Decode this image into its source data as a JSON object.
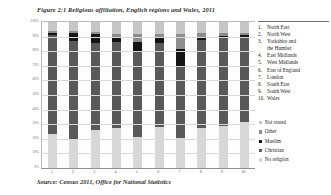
{
  "figure": {
    "title": "Figure 2:1 Religious affiliation, English regions and Wales, 2011",
    "source": "Source: Census 2011, Office for National Statistics"
  },
  "region_list": {
    "items": [
      {
        "num": "1.",
        "name": "North East"
      },
      {
        "num": "2.",
        "name": "North West"
      },
      {
        "num": "3.",
        "name": "Yorkshire and",
        "cont": "the Humber"
      },
      {
        "num": "4.",
        "name": "East Midlands"
      },
      {
        "num": "5.",
        "name": "West Midlands"
      },
      {
        "num": "6.",
        "name": "East of England"
      },
      {
        "num": "7.",
        "name": "London"
      },
      {
        "num": "8.",
        "name": "South East"
      },
      {
        "num": "9.",
        "name": "South West"
      },
      {
        "num": "10.",
        "name": "Wales"
      }
    ]
  },
  "legend": {
    "items": [
      {
        "label": "Not stated",
        "color": "#c6c6c6"
      },
      {
        "label": "Other",
        "color": "#8d8d8d"
      },
      {
        "label": "Muslim",
        "color": "#141414"
      },
      {
        "label": "Christian",
        "color": "#595959"
      },
      {
        "label": "No religion",
        "color": "#d7d7d7"
      }
    ]
  },
  "chart_data": {
    "type": "bar",
    "title": "Figure 2:1 Religious affiliation, English regions and Wales, 2011",
    "subtitle": "",
    "stacked": true,
    "normalized_percent": true,
    "xlabel": "",
    "ylabel": "",
    "ylim": [
      0,
      100
    ],
    "grid": true,
    "legend_position": "right",
    "ytick_labels": [
      "100%",
      "90%",
      "80%",
      "70%",
      "60%",
      "50%",
      "40%",
      "30%",
      "20%",
      "10%",
      "0%"
    ],
    "ytick_values": [
      100,
      90,
      80,
      70,
      60,
      50,
      40,
      30,
      20,
      10,
      0
    ],
    "categories": [
      "1",
      "2",
      "3",
      "4",
      "5",
      "6",
      "7",
      "8",
      "9",
      "10"
    ],
    "category_names": [
      "North East",
      "North West",
      "Yorkshire and the Humber",
      "East Midlands",
      "West Midlands",
      "East of England",
      "London",
      "South East",
      "South West",
      "Wales"
    ],
    "series": [
      {
        "name": "No religion",
        "color": "#d7d7d7",
        "values": [
          23.4,
          19.8,
          25.9,
          27.5,
          21.3,
          27.8,
          20.7,
          27.7,
          28.8,
          31.8
        ]
      },
      {
        "name": "Christian",
        "color": "#595959",
        "values": [
          67.5,
          67.3,
          59.5,
          58.8,
          58.6,
          58.1,
          48.4,
          59.8,
          60.4,
          57.6
        ]
      },
      {
        "name": "Muslim",
        "color": "#141414",
        "values": [
          1.8,
          5.1,
          6.2,
          3.1,
          6.7,
          3.1,
          12.4,
          2.3,
          0.9,
          1.5
        ]
      },
      {
        "name": "Other",
        "color": "#8d8d8d",
        "values": [
          0.9,
          1.4,
          1.9,
          2.3,
          5.0,
          3.1,
          10.2,
          3.0,
          2.5,
          1.3
        ]
      },
      {
        "name": "Not stated",
        "color": "#c6c6c6",
        "values": [
          6.4,
          6.4,
          6.5,
          8.3,
          8.4,
          7.9,
          8.3,
          7.2,
          7.4,
          7.8
        ]
      }
    ]
  }
}
